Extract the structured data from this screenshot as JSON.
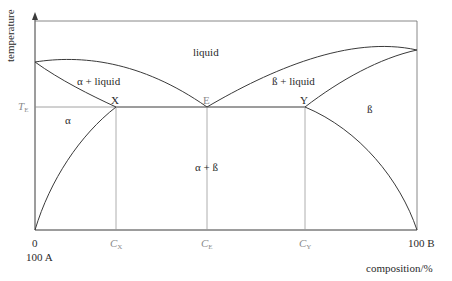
{
  "diagram": {
    "axes": {
      "y_label": "temperature",
      "x_label": "composition/%",
      "x_left_tick": "0",
      "x_left_sub": "100 A",
      "x_right_tick": "100 B",
      "eutectic_temp_label": "T",
      "eutectic_temp_sub": "E"
    },
    "regions": {
      "liquid": "liquid",
      "alpha_liquid": "α + liquid",
      "beta_liquid": "ß + liquid",
      "alpha": "α",
      "beta": "ß",
      "alpha_beta": "α + ß"
    },
    "points": {
      "X": "X",
      "E": "E",
      "Y": "Y"
    },
    "compositions": {
      "cx": "C",
      "cx_sub": "X",
      "ce": "C",
      "ce_sub": "E",
      "cy": "C",
      "cy_sub": "Y"
    },
    "colors": {
      "line": "#3a3a3a",
      "guide": "#9a9a9a",
      "text": "#2a2a2a"
    }
  }
}
